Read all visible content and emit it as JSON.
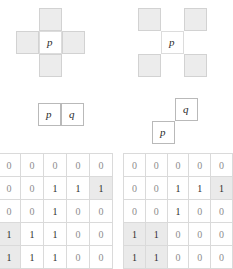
{
  "figure": {
    "diagrams": [
      {
        "id": "four-neighbourhood",
        "kind": "neighbourhood-cross",
        "center_label": "p",
        "shaded_offsets": [
          [
            0,
            -1
          ],
          [
            -1,
            0
          ],
          [
            1,
            0
          ],
          [
            0,
            1
          ]
        ]
      },
      {
        "id": "diagonal-neighbourhood",
        "kind": "neighbourhood-diagonal",
        "center_label": "p",
        "shaded_offsets": [
          [
            -1,
            -1
          ],
          [
            1,
            -1
          ],
          [
            -1,
            1
          ],
          [
            1,
            1
          ]
        ]
      },
      {
        "id": "horizontal-adjacency-pair",
        "kind": "pair-horizontal",
        "labels": [
          "p",
          "q"
        ]
      },
      {
        "id": "diagonal-adjacency-pair",
        "kind": "pair-diagonal",
        "labels": [
          "p",
          "q"
        ]
      }
    ]
  },
  "chart_data": {
    "type": "heatmap",
    "title": "",
    "xlabel": "",
    "ylabel": "",
    "grid": true,
    "legend": "none",
    "matrices": [
      {
        "name": "left-binary-image",
        "rows": 5,
        "cols": 5,
        "values": [
          [
            0,
            0,
            0,
            0,
            0
          ],
          [
            0,
            0,
            1,
            1,
            1
          ],
          [
            0,
            0,
            1,
            0,
            0
          ],
          [
            1,
            1,
            1,
            0,
            0
          ],
          [
            1,
            1,
            1,
            0,
            0
          ]
        ],
        "highlighted_cells": [
          [
            1,
            4
          ],
          [
            3,
            0
          ],
          [
            4,
            0
          ]
        ]
      },
      {
        "name": "right-binary-image",
        "rows": 5,
        "cols": 5,
        "values": [
          [
            0,
            0,
            0,
            0,
            0
          ],
          [
            0,
            0,
            1,
            1,
            1
          ],
          [
            0,
            0,
            1,
            0,
            0
          ],
          [
            1,
            1,
            0,
            0,
            0
          ],
          [
            1,
            1,
            0,
            0,
            0
          ]
        ],
        "highlighted_cells": [
          [
            1,
            4
          ],
          [
            3,
            0
          ],
          [
            3,
            1
          ],
          [
            4,
            0
          ],
          [
            4,
            1
          ]
        ]
      }
    ]
  },
  "colors": {
    "shade": "#ececec",
    "highlight": "#eaeaea",
    "grid_line": "#dadada",
    "cell_border": "#d9d9d9",
    "pair_border": "#b9b9b9",
    "text_one": "#2e2e2e",
    "text_zero": "#8d8d8d"
  }
}
